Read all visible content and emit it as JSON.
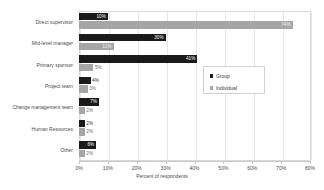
{
  "chart_data": {
    "type": "bar",
    "orientation": "horizontal",
    "title": "",
    "xlabel": "Percent of respondents",
    "ylabel": "",
    "xlim": [
      0,
      80
    ],
    "xticks": [
      0,
      10,
      20,
      30,
      40,
      50,
      60,
      70,
      80
    ],
    "xtick_labels": [
      "0%",
      "10%",
      "20%",
      "30%",
      "40%",
      "50%",
      "60%",
      "70%",
      "80%"
    ],
    "grid": true,
    "legend_position": "center-right",
    "categories": [
      "Direct supervisor",
      "Mid-level manager",
      "Primary sponsor",
      "Project team",
      "Change management team",
      "Human Resources",
      "Other"
    ],
    "series": [
      {
        "name": "Group",
        "color": "#1a1a1a",
        "values": [
          10,
          30,
          41,
          4,
          7,
          2,
          6
        ],
        "value_labels": [
          "10%",
          "30%",
          "41%",
          "4%",
          "7%",
          "2%",
          "6%"
        ]
      },
      {
        "name": "Individual",
        "color": "#a6a6a6",
        "values": [
          74,
          12,
          5,
          3,
          2,
          2,
          2
        ],
        "value_labels": [
          "74%",
          "12%",
          "5%",
          "3%",
          "2%",
          "2%",
          "2%"
        ]
      }
    ]
  },
  "legend": {
    "items": [
      {
        "label": "Group",
        "color": "#1a1a1a"
      },
      {
        "label": "Individual",
        "color": "#a6a6a6"
      }
    ]
  }
}
